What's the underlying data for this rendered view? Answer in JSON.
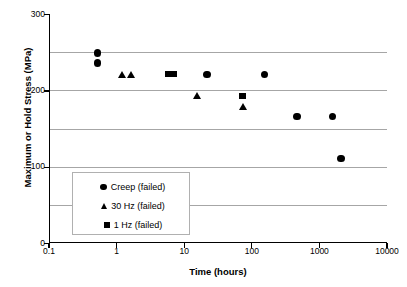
{
  "chart_data": {
    "type": "scatter",
    "title": "",
    "xlabel": "Time (hours)",
    "ylabel": "Maximum or Hold Stress (MPa)",
    "xscale": "log",
    "yscale": "linear",
    "xlim": [
      0.1,
      10000
    ],
    "ylim": [
      0,
      300
    ],
    "xticks": [
      "0.1",
      "1",
      "10",
      "100",
      "1000",
      "10000"
    ],
    "xtick_values": [
      0.1,
      1,
      10,
      100,
      1000,
      10000
    ],
    "yticks": [
      "0",
      "100",
      "200",
      "300"
    ],
    "ytick_values": [
      0,
      100,
      200,
      300
    ],
    "ygrid_values": [
      50,
      100,
      150,
      200,
      250
    ],
    "grid": "horizontal",
    "legend_position": "lower-left-inside",
    "series": [
      {
        "name": "Creep (failed)",
        "marker": "circle",
        "color": "#000000",
        "points": [
          {
            "x": 0.5,
            "y": 249
          },
          {
            "x": 0.5,
            "y": 236
          },
          {
            "x": 21,
            "y": 221
          },
          {
            "x": 150,
            "y": 221
          },
          {
            "x": 450,
            "y": 166
          },
          {
            "x": 1500,
            "y": 166
          },
          {
            "x": 2000,
            "y": 111
          }
        ]
      },
      {
        "name": "30 Hz (failed)",
        "marker": "triangle",
        "color": "#000000",
        "points": [
          {
            "x": 1.15,
            "y": 220
          },
          {
            "x": 1.6,
            "y": 220
          },
          {
            "x": 15,
            "y": 193
          },
          {
            "x": 72,
            "y": 178
          }
        ]
      },
      {
        "name": "1 Hz (failed)",
        "marker": "square",
        "color": "#000000",
        "points": [
          {
            "x": 5.7,
            "y": 221
          },
          {
            "x": 6.6,
            "y": 221
          },
          {
            "x": 70,
            "y": 193
          }
        ]
      }
    ]
  },
  "axes": {
    "y_title": "Maximum or Hold Stress (MPa)",
    "x_title": "Time (hours)"
  },
  "legend": {
    "entries": [
      {
        "label": "Creep (failed)",
        "marker": "circle"
      },
      {
        "label": "30 Hz (failed)",
        "marker": "triangle"
      },
      {
        "label": "1 Hz (failed)",
        "marker": "square"
      }
    ]
  },
  "colors": {
    "marker": "#000000",
    "grid": "#a6a6a6",
    "axis": "#000000",
    "legend_border": "#b0b0b0",
    "background": "#ffffff"
  }
}
